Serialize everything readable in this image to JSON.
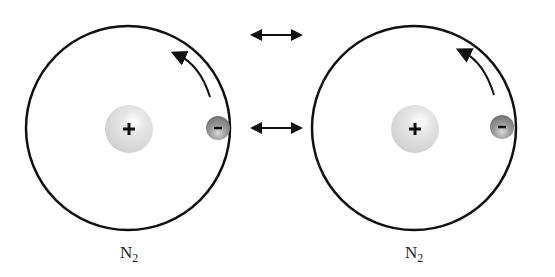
{
  "diagram": {
    "molecules": [
      {
        "label": "N",
        "subscript": "2",
        "nucleus_sign": "+",
        "electron_sign": "-"
      },
      {
        "label": "N",
        "subscript": "2",
        "nucleus_sign": "+",
        "electron_sign": "-"
      }
    ],
    "arrows": {
      "top": "double-headed-arrow",
      "middle": "double-headed-arrow"
    },
    "colors": {
      "outline": "#111111",
      "nucleus": "#d9d9d9",
      "electron": "#8a8a8a",
      "background": "#ffffff"
    }
  }
}
